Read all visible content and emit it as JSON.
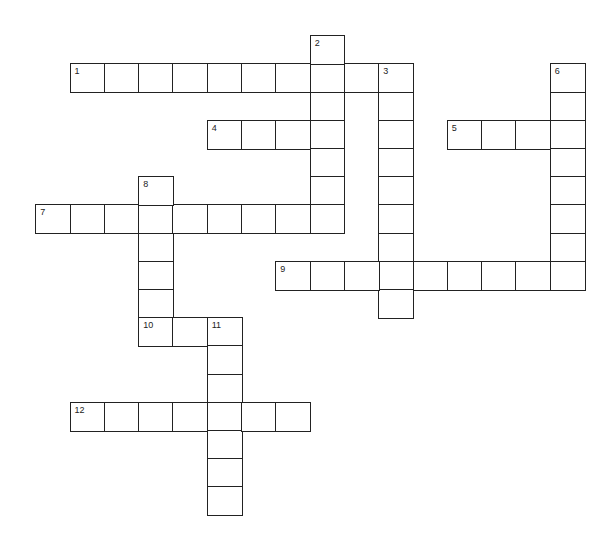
{
  "puzzle": {
    "type": "crossword",
    "cell_width": 34.3,
    "cell_height": 28.2,
    "origin_x": 36,
    "origin_y": 36,
    "border_color": "#222222",
    "background": "#ffffff",
    "words": [
      {
        "number": "1",
        "direction": "across",
        "row": 1,
        "col": 1,
        "length": 10
      },
      {
        "number": "2",
        "direction": "down",
        "row": 0,
        "col": 8,
        "length": 7
      },
      {
        "number": "3",
        "direction": "down",
        "row": 1,
        "col": 10,
        "length": 9
      },
      {
        "number": "4",
        "direction": "across",
        "row": 3,
        "col": 5,
        "length": 4
      },
      {
        "number": "5",
        "direction": "across",
        "row": 3,
        "col": 12,
        "length": 4
      },
      {
        "number": "6",
        "direction": "down",
        "row": 1,
        "col": 15,
        "length": 8
      },
      {
        "number": "7",
        "direction": "across",
        "row": 6,
        "col": 0,
        "length": 9
      },
      {
        "number": "8",
        "direction": "down",
        "row": 5,
        "col": 3,
        "length": 6
      },
      {
        "number": "9",
        "direction": "across",
        "row": 8,
        "col": 7,
        "length": 9
      },
      {
        "number": "10",
        "direction": "across",
        "row": 10,
        "col": 3,
        "length": 3
      },
      {
        "number": "11",
        "direction": "down",
        "row": 10,
        "col": 5,
        "length": 7
      },
      {
        "number": "12",
        "direction": "across",
        "row": 13,
        "col": 1,
        "length": 7
      }
    ]
  }
}
